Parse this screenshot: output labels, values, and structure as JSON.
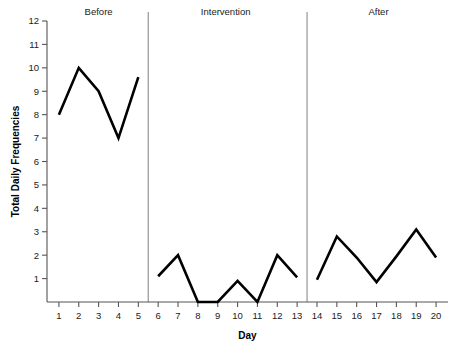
{
  "chart_data": {
    "type": "line",
    "title": "",
    "xlabel": "Day",
    "ylabel": "Total Daily Frequencies",
    "xlim": [
      0.4,
      20.6
    ],
    "ylim": [
      0,
      12
    ],
    "grid": false,
    "legend": null,
    "y_ticks": [
      1,
      2,
      3,
      4,
      5,
      6,
      7,
      8,
      9,
      10,
      11,
      12
    ],
    "x_ticks": [
      1,
      2,
      3,
      4,
      5,
      6,
      7,
      8,
      9,
      10,
      11,
      12,
      13,
      14,
      15,
      16,
      17,
      18,
      19,
      20
    ],
    "line_color": "#000000",
    "line_width": 2.6,
    "phase_line_color": "#8c8c8c",
    "axis_color": "#555555",
    "phase_dividers": [
      5.5,
      13.5
    ],
    "phases": [
      {
        "label": "Before",
        "label_x": 3.0,
        "x": [
          1,
          2,
          3,
          4,
          5
        ],
        "y": [
          8.0,
          10.0,
          9.0,
          7.0,
          9.6
        ]
      },
      {
        "label": "Intervention",
        "label_x": 9.4,
        "x": [
          6,
          7,
          8,
          9,
          10,
          11,
          12,
          13
        ],
        "y": [
          1.1,
          2.0,
          0.0,
          0.0,
          0.9,
          0.0,
          2.0,
          1.05
        ]
      },
      {
        "label": "After",
        "label_x": 17.1,
        "x": [
          14,
          15,
          16,
          17,
          18,
          19,
          20
        ],
        "y": [
          0.95,
          2.8,
          1.9,
          0.85,
          1.95,
          3.1,
          1.9
        ]
      }
    ],
    "series": [
      {
        "name": "Total Daily Frequencies",
        "x": [
          1,
          2,
          3,
          4,
          5,
          6,
          7,
          8,
          9,
          10,
          11,
          12,
          13,
          14,
          15,
          16,
          17,
          18,
          19,
          20
        ],
        "values": [
          8.0,
          10.0,
          9.0,
          7.0,
          9.6,
          1.1,
          2.0,
          0.0,
          0.0,
          0.9,
          0.0,
          2.0,
          1.05,
          0.95,
          2.8,
          1.9,
          0.85,
          1.95,
          3.1,
          1.9
        ]
      }
    ]
  }
}
